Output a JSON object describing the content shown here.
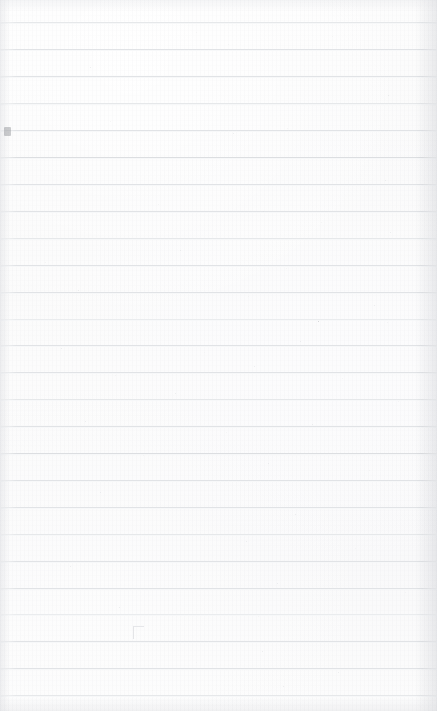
{
  "document": {
    "kind": "scanned-ruled-paper",
    "title": "Blank ruled notebook page",
    "page_width_px": 437,
    "page_height_px": 711,
    "content_text": "",
    "has_handwriting": false,
    "has_printed_text": false,
    "orientation": "portrait"
  },
  "colors": {
    "paper_background": "#fbfbfb",
    "paper_highlight": "#fdfdfd",
    "paper_shadow": "#f9f9fa",
    "rule_line": "#e1e3e6",
    "rule_line_soft": "#e6e8ea",
    "rule_line_softer": "#eaecee",
    "rule_line_firm": "#dcdee1",
    "speck": "#d9dadd",
    "speck_dark": "#b9bbbf",
    "edge_shadow": "#e4e5e8"
  },
  "ruling": {
    "line_count": 26,
    "first_line_y": 22,
    "line_spacing_px": 27,
    "line_thickness_px": 1,
    "margin_rule": "none",
    "lines": [
      {
        "y": 22,
        "weight": "soft"
      },
      {
        "y": 49,
        "weight": "normal"
      },
      {
        "y": 76,
        "weight": "normal"
      },
      {
        "y": 103,
        "weight": "soft"
      },
      {
        "y": 130,
        "weight": "normal"
      },
      {
        "y": 157,
        "weight": "firm"
      },
      {
        "y": 184,
        "weight": "normal"
      },
      {
        "y": 211,
        "weight": "normal"
      },
      {
        "y": 238,
        "weight": "soft"
      },
      {
        "y": 265,
        "weight": "normal"
      },
      {
        "y": 292,
        "weight": "normal"
      },
      {
        "y": 319,
        "weight": "softer"
      },
      {
        "y": 345,
        "weight": "normal"
      },
      {
        "y": 372,
        "weight": "normal"
      },
      {
        "y": 399,
        "weight": "soft"
      },
      {
        "y": 426,
        "weight": "normal"
      },
      {
        "y": 453,
        "weight": "firm"
      },
      {
        "y": 480,
        "weight": "normal"
      },
      {
        "y": 507,
        "weight": "normal"
      },
      {
        "y": 534,
        "weight": "soft"
      },
      {
        "y": 561,
        "weight": "normal"
      },
      {
        "y": 588,
        "weight": "normal"
      },
      {
        "y": 614,
        "weight": "softer"
      },
      {
        "y": 641,
        "weight": "normal"
      },
      {
        "y": 668,
        "weight": "normal"
      },
      {
        "y": 695,
        "weight": "soft"
      }
    ]
  },
  "blemishes": {
    "left_edge_blot": {
      "x": 4,
      "y": 127,
      "description": "small dark speckled mark at left edge"
    },
    "corner_smudge": {
      "x": 133,
      "y": 626,
      "description": "faint corner-shaped pencil smudge"
    },
    "specks": [
      {
        "x": 196,
        "y": 32,
        "size": 1,
        "tone": "pale"
      },
      {
        "x": 332,
        "y": 36,
        "size": 1,
        "tone": "pale"
      },
      {
        "x": 90,
        "y": 67,
        "size": 1,
        "tone": "normal"
      },
      {
        "x": 228,
        "y": 44,
        "size": 1,
        "tone": "pale"
      },
      {
        "x": 388,
        "y": 95,
        "size": 1,
        "tone": "normal"
      },
      {
        "x": 110,
        "y": 121,
        "size": 1,
        "tone": "pale"
      },
      {
        "x": 233,
        "y": 133,
        "size": 1,
        "tone": "normal"
      },
      {
        "x": 287,
        "y": 128,
        "size": 1,
        "tone": "pale"
      },
      {
        "x": 385,
        "y": 180,
        "size": 1,
        "tone": "normal"
      },
      {
        "x": 158,
        "y": 204,
        "size": 1,
        "tone": "pale"
      },
      {
        "x": 263,
        "y": 211,
        "size": 1,
        "tone": "normal"
      },
      {
        "x": 321,
        "y": 222,
        "size": 1,
        "tone": "pale"
      },
      {
        "x": 390,
        "y": 232,
        "size": 1,
        "tone": "normal"
      },
      {
        "x": 45,
        "y": 262,
        "size": 1,
        "tone": "pale"
      },
      {
        "x": 180,
        "y": 250,
        "size": 1,
        "tone": "normal"
      },
      {
        "x": 286,
        "y": 268,
        "size": 1,
        "tone": "pale"
      },
      {
        "x": 78,
        "y": 290,
        "size": 1,
        "tone": "normal"
      },
      {
        "x": 248,
        "y": 296,
        "size": 1,
        "tone": "pale"
      },
      {
        "x": 374,
        "y": 305,
        "size": 1,
        "tone": "normal"
      },
      {
        "x": 127,
        "y": 319,
        "size": 1,
        "tone": "pale"
      },
      {
        "x": 318,
        "y": 321,
        "size": 1,
        "tone": "dark"
      },
      {
        "x": 387,
        "y": 322,
        "size": 1,
        "tone": "pale"
      },
      {
        "x": 61,
        "y": 348,
        "size": 1,
        "tone": "normal"
      },
      {
        "x": 204,
        "y": 352,
        "size": 1,
        "tone": "pale"
      },
      {
        "x": 300,
        "y": 341,
        "size": 1,
        "tone": "normal"
      },
      {
        "x": 115,
        "y": 375,
        "size": 1,
        "tone": "pale"
      },
      {
        "x": 254,
        "y": 366,
        "size": 1,
        "tone": "normal"
      },
      {
        "x": 342,
        "y": 378,
        "size": 1,
        "tone": "pale"
      },
      {
        "x": 175,
        "y": 393,
        "size": 1,
        "tone": "normal"
      },
      {
        "x": 398,
        "y": 401,
        "size": 1,
        "tone": "pale"
      },
      {
        "x": 85,
        "y": 421,
        "size": 1,
        "tone": "normal"
      },
      {
        "x": 226,
        "y": 432,
        "size": 1,
        "tone": "pale"
      },
      {
        "x": 312,
        "y": 424,
        "size": 1,
        "tone": "normal"
      },
      {
        "x": 143,
        "y": 455,
        "size": 1,
        "tone": "pale"
      },
      {
        "x": 268,
        "y": 463,
        "size": 1,
        "tone": "normal"
      },
      {
        "x": 369,
        "y": 470,
        "size": 1,
        "tone": "pale"
      },
      {
        "x": 100,
        "y": 492,
        "size": 1,
        "tone": "normal"
      },
      {
        "x": 213,
        "y": 500,
        "size": 1,
        "tone": "pale"
      },
      {
        "x": 295,
        "y": 514,
        "size": 1,
        "tone": "normal"
      },
      {
        "x": 141,
        "y": 534,
        "size": 1,
        "tone": "pale"
      },
      {
        "x": 246,
        "y": 541,
        "size": 1,
        "tone": "normal"
      },
      {
        "x": 355,
        "y": 548,
        "size": 1,
        "tone": "pale"
      },
      {
        "x": 70,
        "y": 566,
        "size": 1,
        "tone": "normal"
      },
      {
        "x": 190,
        "y": 575,
        "size": 1,
        "tone": "pale"
      },
      {
        "x": 277,
        "y": 583,
        "size": 1,
        "tone": "normal"
      },
      {
        "x": 405,
        "y": 592,
        "size": 1,
        "tone": "pale"
      },
      {
        "x": 119,
        "y": 607,
        "size": 1,
        "tone": "normal"
      },
      {
        "x": 258,
        "y": 616,
        "size": 1,
        "tone": "pale"
      },
      {
        "x": 262,
        "y": 651,
        "size": 1,
        "tone": "normal"
      },
      {
        "x": 196,
        "y": 662,
        "size": 1,
        "tone": "pale"
      },
      {
        "x": 338,
        "y": 672,
        "size": 1,
        "tone": "normal"
      },
      {
        "x": 152,
        "y": 690,
        "size": 1,
        "tone": "pale"
      },
      {
        "x": 283,
        "y": 686,
        "size": 1,
        "tone": "normal"
      }
    ]
  }
}
